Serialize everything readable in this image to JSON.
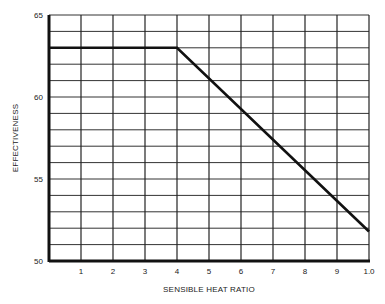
{
  "chart_data": {
    "type": "line",
    "title": "",
    "xlabel": "SENSIBLE HEAT RATIO",
    "ylabel": "EFFECTIVENESS",
    "x_tick_labels": [
      "1",
      "2",
      "3",
      "4",
      "5",
      "6",
      "7",
      "8",
      "9",
      "1.0"
    ],
    "y_tick_labels": [
      "50",
      "55",
      "60",
      "65"
    ],
    "xlim": [
      0,
      1.0
    ],
    "ylim": [
      50,
      65
    ],
    "grid": true,
    "legend": null,
    "series": [
      {
        "name": "Effectiveness",
        "x": [
          0,
          0.4,
          1.0
        ],
        "y": [
          63,
          63,
          51.8
        ]
      }
    ]
  }
}
